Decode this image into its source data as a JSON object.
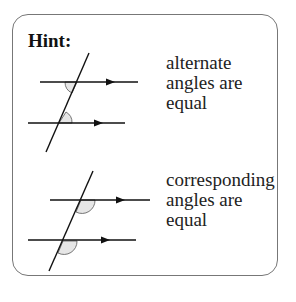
{
  "title": "Hint:",
  "diagrams": [
    {
      "label_lines": [
        "alternate",
        "angles are",
        "equal"
      ],
      "type": "alternate"
    },
    {
      "label_lines": [
        "corresponding",
        "angles are",
        "equal"
      ],
      "type": "corresponding"
    }
  ],
  "colors": {
    "line": "#111111",
    "angle_fill": "#e6e6e6",
    "border": "#777777"
  }
}
